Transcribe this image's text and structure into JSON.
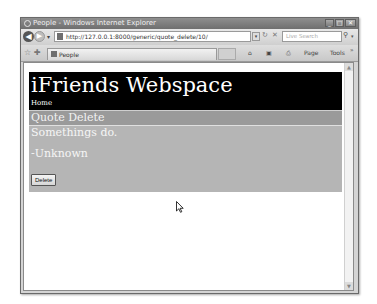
{
  "window": {
    "title": "People - Windows Internet Explorer",
    "controls": {
      "minimize": "_",
      "maximize": "□",
      "close": "✕"
    }
  },
  "toolbar": {
    "back_icon": "◀",
    "forward_icon": "▶",
    "dropdown_icon": "▾",
    "address": "http://127.0.0.1:8000/generic/quote_delete/10/",
    "go_icon": "▾",
    "refresh_icon": "↻",
    "stop_icon": "✕",
    "search_placeholder": "Live Search",
    "search_icon": "⚲",
    "search_drop": "▾"
  },
  "command_bar": {
    "favorites_icon": "☆",
    "add_favorites_icon": "✚",
    "tab_label": "People",
    "home_icon": "⌂",
    "feeds_icon": "▣",
    "print_icon": "⎙",
    "page_label": "Page",
    "tools_label": "Tools",
    "more_icon": "»"
  },
  "page": {
    "site_title": "iFriends Webspace",
    "home_link": "Home",
    "section_title": "Quote Delete",
    "quote_text": "Somethings do.",
    "quote_author": "-Unknown",
    "delete_button": "Delete"
  },
  "scrollbar": {
    "up": "▲",
    "down": "▼"
  }
}
